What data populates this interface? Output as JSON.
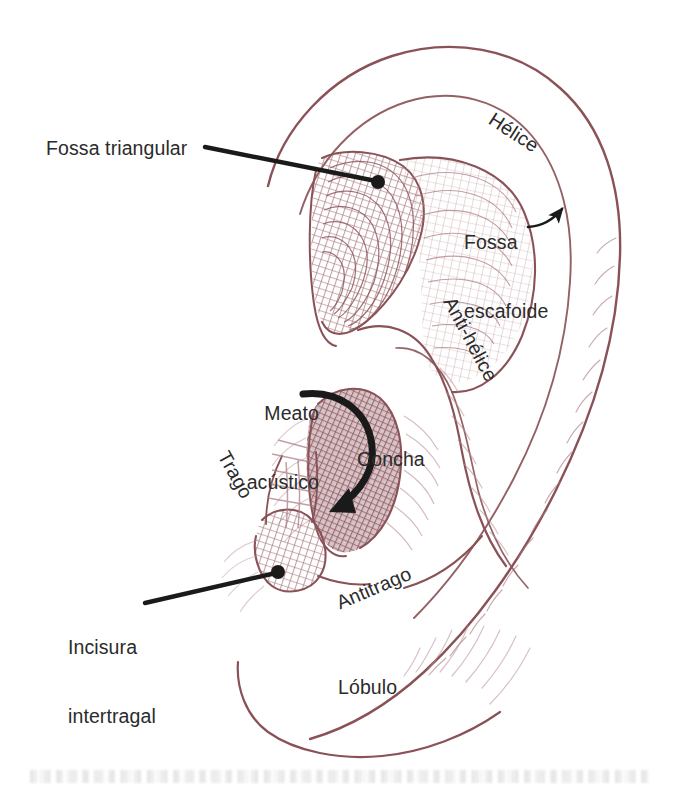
{
  "figure": {
    "language": "pt",
    "background_color": "#ffffff",
    "ink_color": "#8a5257",
    "hatch_color": "#a8787f",
    "label_color": "#2b2b2b",
    "leader_color": "#1a1a1a"
  },
  "labels": {
    "fossa_triangular": "Fossa triangular",
    "helice": "Hélice",
    "fossa_escafoide_line1": "Fossa",
    "fossa_escafoide_line2": "escafoide",
    "anti_helice": "Anti-hélice",
    "meato_line1": "Meato",
    "meato_line2": "acústico",
    "trago": "Trago",
    "concha": "Concha",
    "antitrago": "Antitrago",
    "incisura_line1": "Incisura",
    "incisura_line2": "intertragal",
    "lobulo": "Lóbulo"
  },
  "annotations": [
    {
      "name": "fossa-triangular",
      "text": "Fossa triangular",
      "kind": "leader-line-with-dot",
      "label_position": {
        "x": 46,
        "y": 137
      },
      "leader_start": {
        "x": 205,
        "y": 147
      },
      "leader_end": {
        "x": 378,
        "y": 182
      },
      "dot_radius": 7
    },
    {
      "name": "helice",
      "text": "Hélice",
      "kind": "rotated-text",
      "label_position": {
        "x": 497,
        "y": 108
      },
      "rotation_deg": 33
    },
    {
      "name": "fossa-escafoide",
      "text": "Fossa escafoide",
      "kind": "curved-arrow",
      "label_position": {
        "x": 464,
        "y": 195
      },
      "arrow_start": {
        "x": 535,
        "y": 224
      },
      "arrow_end": {
        "x": 567,
        "y": 206
      }
    },
    {
      "name": "anti-helice",
      "text": "Anti-hélice",
      "kind": "rotated-text",
      "label_position": {
        "x": 459,
        "y": 293
      },
      "rotation_deg": 62
    },
    {
      "name": "meato-acustico",
      "text": "Meato acústico",
      "kind": "thick-curved-arrow",
      "label_position": {
        "x": 219,
        "y": 359
      },
      "arrow_start": {
        "x": 303,
        "y": 395
      },
      "arrow_end": {
        "x": 328,
        "y": 486
      }
    },
    {
      "name": "trago",
      "text": "Trago",
      "kind": "rotated-text",
      "label_position": {
        "x": 233,
        "y": 447
      },
      "rotation_deg": 61
    },
    {
      "name": "concha",
      "text": "Concha",
      "kind": "plain-text",
      "label_position": {
        "x": 357,
        "y": 448
      }
    },
    {
      "name": "antitrago",
      "text": "Antitrago",
      "kind": "rotated-text",
      "label_position": {
        "x": 333,
        "y": 593
      },
      "rotation_deg": -23
    },
    {
      "name": "incisura-intertragal",
      "text": "Incisura intertragal",
      "kind": "leader-line-with-dot",
      "label_position": {
        "x": 68,
        "y": 590
      },
      "leader_start": {
        "x": 145,
        "y": 603
      },
      "leader_end": {
        "x": 278,
        "y": 572
      },
      "dot_radius": 7
    },
    {
      "name": "lobulo",
      "text": "Lóbulo",
      "kind": "plain-text",
      "label_position": {
        "x": 338,
        "y": 676
      }
    }
  ],
  "anatomy_parts": [
    "Hélice",
    "Fossa escafoide",
    "Fossa triangular",
    "Anti-hélice",
    "Concha",
    "Meato acústico",
    "Trago",
    "Antitrago",
    "Incisura intertragal",
    "Lóbulo"
  ]
}
